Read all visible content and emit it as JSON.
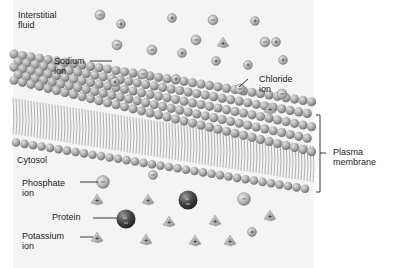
{
  "figure": {
    "regions": {
      "outside": "Interstitial\nfluid",
      "inside": "Cytosol"
    },
    "labels": {
      "sodium": "Sodium\nion",
      "chloride": "Chloride\nion",
      "membrane": "Plasma\nmembrane",
      "phosphate": "Phosphate\nion",
      "protein": "Protein",
      "potassium": "Potassium\nion"
    },
    "symbols": {
      "positive": "+",
      "negative": "−"
    },
    "colors": {
      "background": "#f4f4f4",
      "ion_fill": "#b5b5b5",
      "head_fill": "#a8a8a8",
      "tail_stroke": "#9a9a9a",
      "protein_fill": "#4a4a4a",
      "text": "#1a1a1a"
    },
    "ions": {
      "interstitial": {
        "sodium_positions": [
          [
            121,
            24
          ],
          [
            172,
            18
          ],
          [
            255,
            21
          ],
          [
            276,
            42
          ],
          [
            283,
            60
          ],
          [
            248,
            65
          ],
          [
            216,
            61
          ],
          [
            176,
            79
          ],
          [
            115,
            82
          ],
          [
            182,
            53
          ]
        ],
        "chloride_positions": [
          [
            100,
            15
          ],
          [
            213,
            20
          ],
          [
            117,
            45
          ],
          [
            152,
            50
          ],
          [
            196,
            40
          ],
          [
            265,
            42
          ],
          [
            143,
            74
          ],
          [
            240,
            89
          ],
          [
            282,
            94
          ]
        ],
        "potassium_positions": [
          [
            223,
            43
          ],
          [
            270,
            109
          ]
        ]
      },
      "cytosol": {
        "phosphate_positions": [
          [
            103,
            182
          ],
          [
            153,
            175
          ]
        ],
        "protein_positions": [
          [
            126,
            219
          ],
          [
            188,
            200
          ]
        ],
        "chloride_positions": [
          [
            244,
            199
          ]
        ],
        "sodium_positions": [
          [
            252,
            232
          ]
        ],
        "potassium_positions": [
          [
            97,
            200
          ],
          [
            148,
            200
          ],
          [
            97,
            238
          ],
          [
            146,
            240
          ],
          [
            169,
            222
          ],
          [
            215,
            221
          ],
          [
            230,
            241
          ],
          [
            195,
            241
          ],
          [
            270,
            216
          ]
        ]
      }
    }
  }
}
